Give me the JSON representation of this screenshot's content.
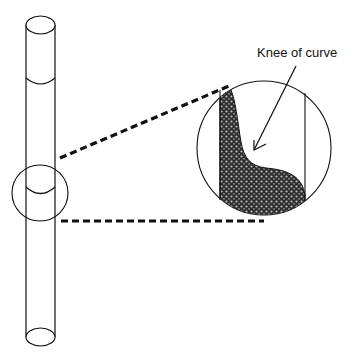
{
  "diagram": {
    "annotation": {
      "label": "Knee of curve"
    },
    "colors": {
      "stroke": "#111111",
      "fill_pattern": "#3a3a3a",
      "background": "#ffffff"
    },
    "elements": {
      "tube": "vertical tube drawn in perspective with top and bottom ellipses",
      "callout_circle_small": "circle on tube marking region of interest",
      "callout_circle_large": "magnified view showing stippled profile with knee",
      "dashed_leaders": "two dashed lines connecting small circle to magnified view"
    }
  }
}
